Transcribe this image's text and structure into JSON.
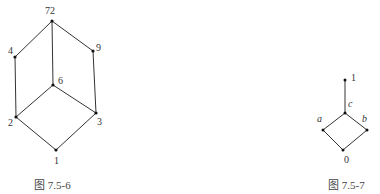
{
  "figures": [
    {
      "id": "fig-7-5-6",
      "caption": "图 7.5-6",
      "nodes": {
        "n72": "72",
        "n4": "4",
        "n9": "9",
        "n6": "6",
        "n2": "2",
        "n3": "3",
        "n1": "1"
      },
      "edges": [
        [
          "72",
          "4"
        ],
        [
          "72",
          "6"
        ],
        [
          "72",
          "9"
        ],
        [
          "4",
          "2"
        ],
        [
          "9",
          "3"
        ],
        [
          "6",
          "2"
        ],
        [
          "6",
          "3"
        ],
        [
          "2",
          "1"
        ],
        [
          "3",
          "1"
        ]
      ]
    },
    {
      "id": "fig-7-5-7",
      "caption": "图 7.5-7",
      "nodes": {
        "top": "1",
        "c": "c",
        "a": "a",
        "b": "b",
        "bottom": "0"
      },
      "edges": [
        [
          "1",
          "c"
        ],
        [
          "c",
          "a"
        ],
        [
          "c",
          "b"
        ],
        [
          "a",
          "0"
        ],
        [
          "b",
          "0"
        ]
      ]
    }
  ]
}
